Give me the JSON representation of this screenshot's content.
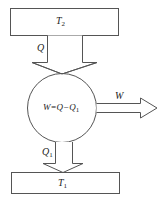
{
  "diagram": {
    "colors": {
      "stroke": "#555555",
      "background": "#ffffff",
      "text": "#222222"
    },
    "hot_reservoir": {
      "label_main": "T",
      "label_sub": "2"
    },
    "cold_reservoir": {
      "label_main": "T",
      "label_sub": "1"
    },
    "heat_in": {
      "label_main": "Q",
      "label_sub": ""
    },
    "heat_out": {
      "label_main": "Q",
      "label_sub": "1"
    },
    "engine": {
      "label_prefix": "W=Q−Q",
      "label_sub": "1"
    },
    "work_out": {
      "label_main": "W"
    }
  }
}
